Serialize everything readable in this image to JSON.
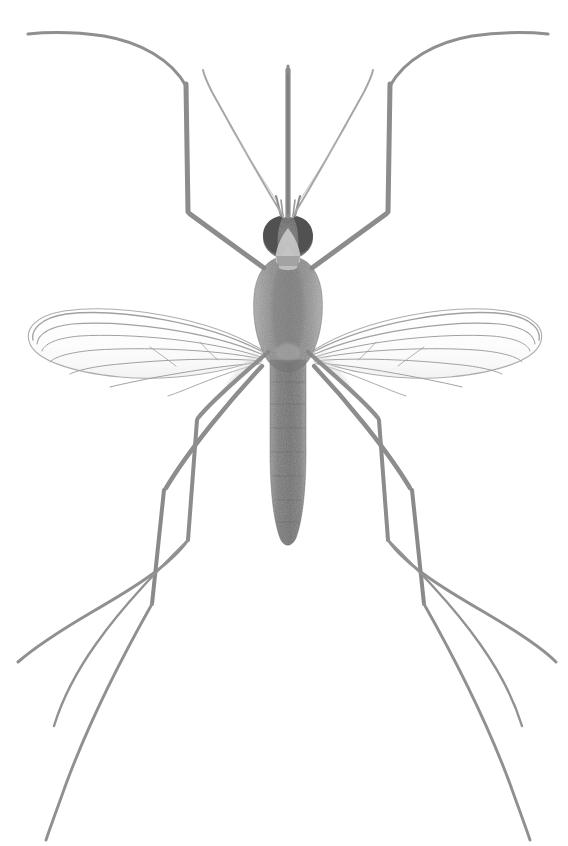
{
  "image": {
    "subject": "mosquito",
    "view": "dorsal",
    "medium": "grayscale scanned illustration",
    "background_color": "#ffffff",
    "canvas": {
      "width": 568,
      "height": 846
    }
  },
  "palette": {
    "background": "#ffffff",
    "abdomen_dark": "#6a6a6a",
    "thorax_gray": "#8a8a8a",
    "thorax_shade": "#777777",
    "eye_dark": "#565656",
    "clypeus_pale": "#cfcfcf",
    "leg_gray": "#8e8e8e",
    "leg_dark": "#7a7a7a",
    "wing_vein": "#9a9a9a",
    "wing_membrane": "#fdfdfd",
    "antenna_gray": "#a6a6a6",
    "proboscis_gray": "#8c8c8c"
  },
  "anatomy": {
    "proboscis": {
      "label": "proboscis",
      "x": 288,
      "y_top": 68,
      "y_bottom": 214,
      "width": 5
    },
    "antennae": {
      "label": "antennae",
      "count": 2,
      "style": "thin curved arcs",
      "tip_left_x": 205,
      "tip_right_x": 372,
      "tip_y": 70
    },
    "head": {
      "label": "head",
      "center_x": 288,
      "center_y": 238,
      "width": 48,
      "height": 42
    },
    "eyes": {
      "label": "compound-eyes",
      "count": 2,
      "color": "#565656"
    },
    "clypeus": {
      "label": "clypeus",
      "color": "#cfcfcf"
    },
    "thorax": {
      "label": "thorax",
      "center_x": 288,
      "center_y": 305,
      "width": 56,
      "height": 96
    },
    "abdomen": {
      "label": "abdomen",
      "center_x": 288,
      "y_top": 362,
      "y_bottom": 548,
      "width": 38,
      "segments": 8
    },
    "wings": {
      "label": "wings",
      "count": 2,
      "left": {
        "base_x": 262,
        "base_y": 352,
        "tip_x": 28,
        "tip_y": 330
      },
      "right": {
        "base_x": 314,
        "base_y": 352,
        "tip_x": 540,
        "tip_y": 330
      },
      "veins_per_wing": 7
    },
    "legs": {
      "label": "legs",
      "count": 6,
      "pairs": [
        "foreleg",
        "midleg",
        "hindleg"
      ],
      "description": "long slender legs with sharp femoro-tibial bends, tapering tarsi"
    }
  },
  "labels": {
    "title": "Mosquito, dorsal view",
    "alt": "Grayscale scientific illustration of a mosquito seen from above, showing proboscis, antennae, compound eyes, thorax, segmented abdomen, two veined wings and six long legs."
  }
}
